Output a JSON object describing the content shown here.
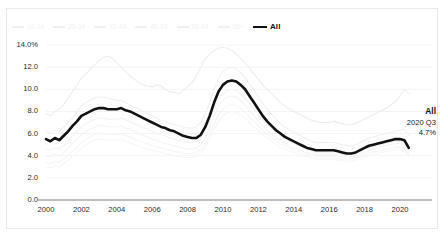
{
  "chart_data": {
    "type": "line",
    "title": "",
    "xlabel": "",
    "ylabel": "",
    "ylim": [
      0,
      14
    ],
    "xlim": [
      2000,
      2020.75
    ],
    "grid": true,
    "grid_axis": "y",
    "legend_position": "top-left",
    "y_ticks": [
      "14.0%",
      "12.0",
      "10.0",
      "8.0",
      "6.0",
      "4.0",
      "2.0",
      "0.0"
    ],
    "y_tick_values": [
      14.0,
      12.0,
      10.0,
      8.0,
      6.0,
      4.0,
      2.0,
      0.0
    ],
    "x_ticks": [
      "2000",
      "2002",
      "2004",
      "2006",
      "2008",
      "2010",
      "2012",
      "2014",
      "2016",
      "2018",
      "2020"
    ],
    "x_tick_values": [
      2000,
      2002,
      2004,
      2006,
      2008,
      2010,
      2012,
      2014,
      2016,
      2018,
      2020
    ],
    "x": [
      2000.0,
      2000.25,
      2000.5,
      2000.75,
      2001.0,
      2001.25,
      2001.5,
      2001.75,
      2002.0,
      2002.25,
      2002.5,
      2002.75,
      2003.0,
      2003.25,
      2003.5,
      2003.75,
      2004.0,
      2004.25,
      2004.5,
      2004.75,
      2005.0,
      2005.25,
      2005.5,
      2005.75,
      2006.0,
      2006.25,
      2006.5,
      2006.75,
      2007.0,
      2007.25,
      2007.5,
      2007.75,
      2008.0,
      2008.25,
      2008.5,
      2008.75,
      2009.0,
      2009.25,
      2009.5,
      2009.75,
      2010.0,
      2010.25,
      2010.5,
      2010.75,
      2011.0,
      2011.25,
      2011.5,
      2011.75,
      2012.0,
      2012.25,
      2012.5,
      2012.75,
      2013.0,
      2013.25,
      2013.5,
      2013.75,
      2014.0,
      2014.25,
      2014.5,
      2014.75,
      2015.0,
      2015.25,
      2015.5,
      2015.75,
      2016.0,
      2016.25,
      2016.5,
      2016.75,
      2017.0,
      2017.25,
      2017.5,
      2017.75,
      2018.0,
      2018.25,
      2018.5,
      2018.75,
      2019.0,
      2019.25,
      2019.5,
      2019.75,
      2020.0,
      2020.25,
      2020.5
    ],
    "series": [
      {
        "name": "All",
        "color": "#111111",
        "emphasis": true,
        "width": 2.6,
        "values": [
          5.5,
          5.3,
          5.6,
          5.4,
          5.8,
          6.2,
          6.7,
          7.1,
          7.6,
          7.8,
          8.0,
          8.2,
          8.3,
          8.3,
          8.2,
          8.2,
          8.2,
          8.3,
          8.1,
          8.0,
          7.8,
          7.6,
          7.4,
          7.2,
          7.0,
          6.8,
          6.6,
          6.5,
          6.3,
          6.2,
          6.0,
          5.8,
          5.7,
          5.6,
          5.6,
          5.9,
          6.6,
          7.6,
          8.8,
          9.8,
          10.4,
          10.7,
          10.8,
          10.7,
          10.4,
          10.0,
          9.4,
          8.8,
          8.2,
          7.6,
          7.1,
          6.7,
          6.3,
          6.0,
          5.7,
          5.5,
          5.3,
          5.1,
          4.9,
          4.7,
          4.6,
          4.5,
          4.5,
          4.5,
          4.5,
          4.5,
          4.4,
          4.3,
          4.2,
          4.2,
          4.3,
          4.5,
          4.7,
          4.9,
          5.0,
          5.1,
          5.2,
          5.3,
          5.4,
          5.5,
          5.5,
          5.4,
          4.7
        ]
      },
      {
        "name": "16-24",
        "color": "#ededed",
        "emphasis": false,
        "width": 1.1,
        "values": [
          7.8,
          7.6,
          8.0,
          8.2,
          8.6,
          9.2,
          9.8,
          10.4,
          11.0,
          11.4,
          11.8,
          12.2,
          12.6,
          12.9,
          13.0,
          12.8,
          12.4,
          12.0,
          11.6,
          11.2,
          10.9,
          10.6,
          10.4,
          10.3,
          10.2,
          10.4,
          10.3,
          10.0,
          9.8,
          9.7,
          9.6,
          9.9,
          10.2,
          10.6,
          11.2,
          12.0,
          12.8,
          13.2,
          13.5,
          13.7,
          13.8,
          13.7,
          13.5,
          13.2,
          12.8,
          12.4,
          11.9,
          11.4,
          10.9,
          10.4,
          10.0,
          9.6,
          9.2,
          8.8,
          8.5,
          8.2,
          8.0,
          7.8,
          7.6,
          7.4,
          7.2,
          7.1,
          7.0,
          7.0,
          7.0,
          7.1,
          7.0,
          6.9,
          6.8,
          6.8,
          6.9,
          7.1,
          7.3,
          7.5,
          7.7,
          7.9,
          8.1,
          8.3,
          8.6,
          8.9,
          9.4,
          10.0,
          9.6
        ]
      },
      {
        "name": "25-34",
        "color": "#f1f1f1",
        "emphasis": false,
        "width": 1.1,
        "values": [
          6.2,
          6.0,
          6.3,
          6.2,
          6.6,
          7.0,
          7.5,
          8.0,
          8.5,
          8.8,
          9.0,
          9.2,
          9.3,
          9.3,
          9.2,
          9.1,
          9.0,
          9.0,
          8.8,
          8.6,
          8.4,
          8.2,
          8.0,
          7.8,
          7.6,
          7.4,
          7.2,
          7.1,
          6.9,
          6.8,
          6.7,
          6.6,
          6.5,
          6.5,
          6.6,
          7.0,
          7.8,
          8.8,
          10.0,
          11.0,
          11.6,
          11.9,
          12.0,
          11.8,
          11.5,
          11.0,
          10.5,
          9.9,
          9.3,
          8.7,
          8.2,
          7.7,
          7.3,
          6.9,
          6.6,
          6.3,
          6.1,
          5.9,
          5.7,
          5.5,
          5.3,
          5.2,
          5.2,
          5.2,
          5.2,
          5.2,
          5.1,
          5.0,
          4.9,
          4.9,
          5.0,
          5.2,
          5.4,
          5.6,
          5.7,
          5.8,
          5.9,
          6.0,
          6.1,
          6.2,
          6.3,
          6.4,
          5.8
        ]
      },
      {
        "name": "35-44",
        "color": "#f3f3f3",
        "emphasis": false,
        "width": 1.1,
        "values": [
          4.6,
          4.5,
          4.7,
          4.6,
          4.9,
          5.3,
          5.8,
          6.2,
          6.6,
          6.9,
          7.1,
          7.3,
          7.4,
          7.4,
          7.3,
          7.3,
          7.3,
          7.4,
          7.2,
          7.1,
          6.9,
          6.7,
          6.5,
          6.4,
          6.2,
          6.0,
          5.9,
          5.8,
          5.6,
          5.5,
          5.4,
          5.3,
          5.2,
          5.2,
          5.3,
          5.6,
          6.2,
          7.1,
          8.2,
          9.1,
          9.6,
          9.9,
          10.0,
          9.9,
          9.6,
          9.2,
          8.7,
          8.2,
          7.7,
          7.2,
          6.8,
          6.4,
          6.1,
          5.8,
          5.5,
          5.3,
          5.1,
          4.9,
          4.7,
          4.6,
          4.4,
          4.3,
          4.3,
          4.3,
          4.3,
          4.3,
          4.2,
          4.1,
          4.0,
          4.0,
          4.1,
          4.3,
          4.5,
          4.7,
          4.8,
          4.9,
          5.0,
          5.1,
          5.2,
          5.3,
          5.3,
          5.2,
          4.5
        ]
      },
      {
        "name": "45-54",
        "color": "#f4f4f4",
        "emphasis": false,
        "width": 1.1,
        "values": [
          4.0,
          3.9,
          4.1,
          4.0,
          4.3,
          4.7,
          5.1,
          5.5,
          5.9,
          6.2,
          6.4,
          6.6,
          6.7,
          6.7,
          6.6,
          6.6,
          6.6,
          6.7,
          6.5,
          6.4,
          6.2,
          6.0,
          5.8,
          5.7,
          5.5,
          5.4,
          5.2,
          5.1,
          5.0,
          4.9,
          4.8,
          4.7,
          4.6,
          4.6,
          4.7,
          5.0,
          5.6,
          6.5,
          7.6,
          8.5,
          9.0,
          9.3,
          9.4,
          9.3,
          9.0,
          8.6,
          8.1,
          7.6,
          7.1,
          6.7,
          6.3,
          5.9,
          5.6,
          5.4,
          5.1,
          4.9,
          4.7,
          4.6,
          4.4,
          4.3,
          4.2,
          4.1,
          4.1,
          4.1,
          4.1,
          4.1,
          4.0,
          3.9,
          3.9,
          3.9,
          4.0,
          4.1,
          4.3,
          4.5,
          4.6,
          4.7,
          4.8,
          4.9,
          5.0,
          5.1,
          5.1,
          5.0,
          4.3
        ]
      },
      {
        "name": "55-64",
        "color": "#f5f5f5",
        "emphasis": false,
        "width": 1.1,
        "values": [
          3.4,
          3.3,
          3.5,
          3.4,
          3.7,
          4.0,
          4.4,
          4.8,
          5.2,
          5.5,
          5.7,
          5.9,
          6.0,
          6.0,
          5.9,
          5.9,
          5.9,
          6.0,
          5.8,
          5.7,
          5.5,
          5.3,
          5.2,
          5.1,
          4.9,
          4.8,
          4.7,
          4.6,
          4.5,
          4.4,
          4.3,
          4.2,
          4.2,
          4.2,
          4.3,
          4.6,
          5.1,
          5.9,
          6.9,
          7.7,
          8.2,
          8.5,
          8.6,
          8.5,
          8.3,
          7.9,
          7.5,
          7.1,
          6.7,
          6.3,
          5.9,
          5.6,
          5.3,
          5.1,
          4.9,
          4.7,
          4.5,
          4.4,
          4.2,
          4.1,
          4.0,
          3.9,
          3.9,
          3.9,
          3.9,
          3.9,
          3.8,
          3.8,
          3.7,
          3.7,
          3.8,
          3.9,
          4.1,
          4.2,
          4.3,
          4.4,
          4.5,
          4.6,
          4.7,
          4.8,
          4.8,
          4.7,
          4.1
        ]
      },
      {
        "name": "65+",
        "color": "#f6f6f6",
        "emphasis": false,
        "width": 1.1,
        "values": [
          3.0,
          2.9,
          3.1,
          3.0,
          3.3,
          3.6,
          4.0,
          4.3,
          4.7,
          5.0,
          5.2,
          5.4,
          5.5,
          5.5,
          5.4,
          5.4,
          5.4,
          5.5,
          5.3,
          5.2,
          5.0,
          4.9,
          4.7,
          4.6,
          4.5,
          4.4,
          4.3,
          4.2,
          4.1,
          4.0,
          3.9,
          3.9,
          3.8,
          3.9,
          4.0,
          4.3,
          4.8,
          5.5,
          6.4,
          7.1,
          7.6,
          7.9,
          8.0,
          7.9,
          7.7,
          7.4,
          7.0,
          6.6,
          6.3,
          5.9,
          5.6,
          5.3,
          5.0,
          4.8,
          4.6,
          4.4,
          4.3,
          4.1,
          4.0,
          3.9,
          3.8,
          3.7,
          3.7,
          3.7,
          3.7,
          3.7,
          3.6,
          3.6,
          3.5,
          3.5,
          3.6,
          3.7,
          3.9,
          4.0,
          4.1,
          4.2,
          4.3,
          4.4,
          4.5,
          4.6,
          4.6,
          4.5,
          3.9
        ]
      }
    ],
    "annotations": [
      {
        "title": "All",
        "period": "2020 Q3",
        "value": "4.7%"
      }
    ]
  },
  "legend": {
    "items": [
      {
        "label": "16-24",
        "color": "#ededed"
      },
      {
        "label": "25-34",
        "color": "#f1f1f1"
      },
      {
        "label": "35-44",
        "color": "#f3f3f3"
      },
      {
        "label": "45-54",
        "color": "#f4f4f4"
      },
      {
        "label": "55-64",
        "color": "#f5f5f5"
      },
      {
        "label": "65+",
        "color": "#f6f6f6"
      },
      {
        "label": "All",
        "color": "#111111"
      }
    ]
  },
  "annotation": {
    "title": "All",
    "period": "2020 Q3",
    "value": "4.7%"
  },
  "colors": {
    "emphasis_line": "#111111",
    "muted_line": "#f1f1f1",
    "gridline": "#f4f4f4",
    "axis": "#808080",
    "frame": "#e9e9e9",
    "tick_text": "#2b2b2b"
  }
}
